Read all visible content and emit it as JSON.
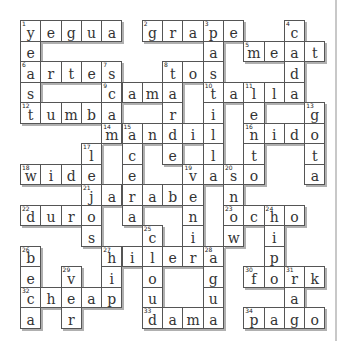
{
  "puzzle": {
    "type": "crossword",
    "cols": 15,
    "rows": 15,
    "colors": {
      "border": "#555555",
      "shadow": "#b0b0b0",
      "text": "#333333",
      "page_border": "#c8c8c8"
    },
    "cells": [
      {
        "r": 0,
        "c": 0,
        "l": "y",
        "n": "1"
      },
      {
        "r": 0,
        "c": 1,
        "l": "e"
      },
      {
        "r": 0,
        "c": 2,
        "l": "g"
      },
      {
        "r": 0,
        "c": 3,
        "l": "u"
      },
      {
        "r": 0,
        "c": 4,
        "l": "a"
      },
      {
        "r": 0,
        "c": 6,
        "l": "g",
        "n": "2"
      },
      {
        "r": 0,
        "c": 7,
        "l": "r"
      },
      {
        "r": 0,
        "c": 8,
        "l": "a"
      },
      {
        "r": 0,
        "c": 9,
        "l": "p",
        "n": "3"
      },
      {
        "r": 0,
        "c": 10,
        "l": "e"
      },
      {
        "r": 0,
        "c": 13,
        "l": "c",
        "n": "4"
      },
      {
        "r": 1,
        "c": 0,
        "l": "e"
      },
      {
        "r": 1,
        "c": 9,
        "l": "a"
      },
      {
        "r": 1,
        "c": 11,
        "l": "m",
        "n": "5"
      },
      {
        "r": 1,
        "c": 12,
        "l": "e"
      },
      {
        "r": 1,
        "c": 13,
        "l": "a"
      },
      {
        "r": 1,
        "c": 14,
        "l": "t"
      },
      {
        "r": 2,
        "c": 0,
        "l": "a",
        "n": "6"
      },
      {
        "r": 2,
        "c": 1,
        "l": "r"
      },
      {
        "r": 2,
        "c": 2,
        "l": "t"
      },
      {
        "r": 2,
        "c": 3,
        "l": "e"
      },
      {
        "r": 2,
        "c": 4,
        "l": "s",
        "n": "7"
      },
      {
        "r": 2,
        "c": 7,
        "l": "t",
        "n": "8"
      },
      {
        "r": 2,
        "c": 8,
        "l": "o"
      },
      {
        "r": 2,
        "c": 9,
        "l": "s"
      },
      {
        "r": 2,
        "c": 13,
        "l": "d"
      },
      {
        "r": 3,
        "c": 0,
        "l": "s"
      },
      {
        "r": 3,
        "c": 4,
        "l": "c",
        "n": "9"
      },
      {
        "r": 3,
        "c": 5,
        "l": "a"
      },
      {
        "r": 3,
        "c": 6,
        "l": "m"
      },
      {
        "r": 3,
        "c": 7,
        "l": "a"
      },
      {
        "r": 3,
        "c": 9,
        "l": "t",
        "n": "10"
      },
      {
        "r": 3,
        "c": 10,
        "l": "a"
      },
      {
        "r": 3,
        "c": 11,
        "l": "l",
        "n": "11"
      },
      {
        "r": 3,
        "c": 12,
        "l": "l"
      },
      {
        "r": 3,
        "c": 13,
        "l": "a"
      },
      {
        "r": 4,
        "c": 0,
        "l": "t",
        "n": "12"
      },
      {
        "r": 4,
        "c": 1,
        "l": "u"
      },
      {
        "r": 4,
        "c": 2,
        "l": "m"
      },
      {
        "r": 4,
        "c": 3,
        "l": "b"
      },
      {
        "r": 4,
        "c": 4,
        "l": "a"
      },
      {
        "r": 4,
        "c": 7,
        "l": "r"
      },
      {
        "r": 4,
        "c": 9,
        "l": "i"
      },
      {
        "r": 4,
        "c": 11,
        "l": "e"
      },
      {
        "r": 4,
        "c": 14,
        "l": "g",
        "n": "13"
      },
      {
        "r": 5,
        "c": 4,
        "l": "m",
        "n": "14"
      },
      {
        "r": 5,
        "c": 5,
        "l": "a",
        "n": "15"
      },
      {
        "r": 5,
        "c": 6,
        "l": "n"
      },
      {
        "r": 5,
        "c": 7,
        "l": "d"
      },
      {
        "r": 5,
        "c": 8,
        "l": "i"
      },
      {
        "r": 5,
        "c": 9,
        "l": "l"
      },
      {
        "r": 5,
        "c": 11,
        "l": "n",
        "n": "16"
      },
      {
        "r": 5,
        "c": 12,
        "l": "i"
      },
      {
        "r": 5,
        "c": 13,
        "l": "d"
      },
      {
        "r": 5,
        "c": 14,
        "l": "o"
      },
      {
        "r": 6,
        "c": 3,
        "l": "l",
        "n": "17"
      },
      {
        "r": 6,
        "c": 5,
        "l": "c"
      },
      {
        "r": 6,
        "c": 7,
        "l": "e"
      },
      {
        "r": 6,
        "c": 9,
        "l": "l"
      },
      {
        "r": 6,
        "c": 11,
        "l": "t"
      },
      {
        "r": 6,
        "c": 14,
        "l": "t"
      },
      {
        "r": 7,
        "c": 0,
        "l": "w",
        "n": "18"
      },
      {
        "r": 7,
        "c": 1,
        "l": "i"
      },
      {
        "r": 7,
        "c": 2,
        "l": "d"
      },
      {
        "r": 7,
        "c": 3,
        "l": "e"
      },
      {
        "r": 7,
        "c": 5,
        "l": "e"
      },
      {
        "r": 7,
        "c": 8,
        "l": "v",
        "n": "19"
      },
      {
        "r": 7,
        "c": 9,
        "l": "a"
      },
      {
        "r": 7,
        "c": 10,
        "l": "s",
        "n": "20"
      },
      {
        "r": 7,
        "c": 11,
        "l": "o"
      },
      {
        "r": 7,
        "c": 14,
        "l": "a"
      },
      {
        "r": 8,
        "c": 3,
        "l": "j",
        "n": "21"
      },
      {
        "r": 8,
        "c": 4,
        "l": "a"
      },
      {
        "r": 8,
        "c": 5,
        "l": "r"
      },
      {
        "r": 8,
        "c": 6,
        "l": "a"
      },
      {
        "r": 8,
        "c": 7,
        "l": "b"
      },
      {
        "r": 8,
        "c": 8,
        "l": "e"
      },
      {
        "r": 8,
        "c": 10,
        "l": "n"
      },
      {
        "r": 9,
        "c": 0,
        "l": "d",
        "n": "22"
      },
      {
        "r": 9,
        "c": 1,
        "l": "u"
      },
      {
        "r": 9,
        "c": 2,
        "l": "r"
      },
      {
        "r": 9,
        "c": 3,
        "l": "o"
      },
      {
        "r": 9,
        "c": 5,
        "l": "a"
      },
      {
        "r": 9,
        "c": 8,
        "l": "n"
      },
      {
        "r": 9,
        "c": 10,
        "l": "o",
        "n": "23"
      },
      {
        "r": 9,
        "c": 11,
        "l": "c"
      },
      {
        "r": 9,
        "c": 12,
        "l": "h",
        "n": "24"
      },
      {
        "r": 9,
        "c": 13,
        "l": "o"
      },
      {
        "r": 10,
        "c": 3,
        "l": "s"
      },
      {
        "r": 10,
        "c": 6,
        "l": "c",
        "n": "25"
      },
      {
        "r": 10,
        "c": 8,
        "l": "i"
      },
      {
        "r": 10,
        "c": 10,
        "l": "w"
      },
      {
        "r": 10,
        "c": 12,
        "l": "i"
      },
      {
        "r": 11,
        "c": 0,
        "l": "b",
        "n": "26"
      },
      {
        "r": 11,
        "c": 4,
        "l": "h",
        "n": "27"
      },
      {
        "r": 11,
        "c": 5,
        "l": "i"
      },
      {
        "r": 11,
        "c": 6,
        "l": "l"
      },
      {
        "r": 11,
        "c": 7,
        "l": "e"
      },
      {
        "r": 11,
        "c": 8,
        "l": "r"
      },
      {
        "r": 11,
        "c": 9,
        "l": "a",
        "n": "28"
      },
      {
        "r": 11,
        "c": 12,
        "l": "p"
      },
      {
        "r": 12,
        "c": 0,
        "l": "e"
      },
      {
        "r": 12,
        "c": 2,
        "l": "v",
        "n": "29"
      },
      {
        "r": 12,
        "c": 4,
        "l": "i"
      },
      {
        "r": 12,
        "c": 6,
        "l": "o"
      },
      {
        "r": 12,
        "c": 9,
        "l": "g"
      },
      {
        "r": 12,
        "c": 11,
        "l": "f",
        "n": "30"
      },
      {
        "r": 12,
        "c": 12,
        "l": "o"
      },
      {
        "r": 12,
        "c": 13,
        "l": "r",
        "n": "31"
      },
      {
        "r": 12,
        "c": 14,
        "l": "k"
      },
      {
        "r": 13,
        "c": 0,
        "l": "c",
        "n": "32"
      },
      {
        "r": 13,
        "c": 1,
        "l": "h"
      },
      {
        "r": 13,
        "c": 2,
        "l": "e"
      },
      {
        "r": 13,
        "c": 3,
        "l": "a"
      },
      {
        "r": 13,
        "c": 4,
        "l": "p"
      },
      {
        "r": 13,
        "c": 6,
        "l": "u"
      },
      {
        "r": 13,
        "c": 9,
        "l": "u"
      },
      {
        "r": 13,
        "c": 13,
        "l": "a"
      },
      {
        "r": 14,
        "c": 0,
        "l": "a"
      },
      {
        "r": 14,
        "c": 2,
        "l": "r"
      },
      {
        "r": 14,
        "c": 6,
        "l": "d",
        "n": "33"
      },
      {
        "r": 14,
        "c": 7,
        "l": "a"
      },
      {
        "r": 14,
        "c": 8,
        "l": "m"
      },
      {
        "r": 14,
        "c": 9,
        "l": "a"
      },
      {
        "r": 14,
        "c": 11,
        "l": "p",
        "n": "34"
      },
      {
        "r": 14,
        "c": 12,
        "l": "a"
      },
      {
        "r": 14,
        "c": 13,
        "l": "g"
      },
      {
        "r": 14,
        "c": 14,
        "l": "o"
      }
    ],
    "across": [
      "1 yegua",
      "2 grape",
      "5 meat",
      "6 artes",
      "8 tos",
      "9 cama",
      "10 talla",
      "12 tumba",
      "14 mandil",
      "16 nido",
      "18 wide",
      "19 vaso",
      "21 jarabe",
      "22 duro",
      "23 ocho",
      "27 hilera",
      "30 fork",
      "32 cheap",
      "33 dama",
      "34 pago"
    ],
    "down": [
      "1 yeas",
      "3 pastilla",
      "4 cadena",
      "7 scar",
      "8 tarde",
      "11 lento",
      "13 gota",
      "15 acera",
      "17 lejos",
      "19 venir",
      "20 snow",
      "24 hipo",
      "25 cloud",
      "26 beca",
      "27 hip",
      "28 agua",
      "29 ver",
      "31 rag"
    ]
  }
}
